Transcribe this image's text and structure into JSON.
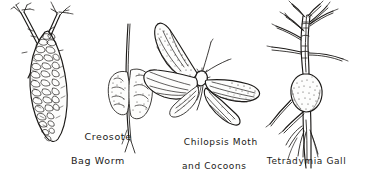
{
  "plate": {
    "kind": "pen-and-ink natural history illustration plate",
    "background_color": "#ffffff",
    "ink_color": "#1c1a18",
    "width_px": 371,
    "height_px": 172
  },
  "specimens": [
    {
      "id": "creosote-bag-worm",
      "caption_line1": "Creosote",
      "caption_line2": "Bag Worm",
      "subject": "bagworm case hanging from crossed creosote twigs"
    },
    {
      "id": "chilopsis-moth",
      "caption_line1": "Chilopsis Moth",
      "caption_line2": "and Cocoons",
      "subject": "spread-winged moth with two cocoons on a stem"
    },
    {
      "id": "tetradymia-gall",
      "caption_line1": "Tetradymia Gall",
      "caption_line2": "",
      "subject": "swollen stem gall on a branching shrub twig"
    }
  ]
}
